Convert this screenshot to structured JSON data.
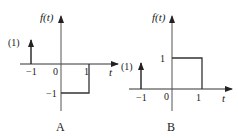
{
  "figure": {
    "panels": [
      {
        "id": "A",
        "caption": "A",
        "y_axis_label": "f(t)",
        "x_axis_label": "t",
        "impulse_label": "(1)",
        "ticks": {
          "neg_one": "−1",
          "zero": "0",
          "one": "1",
          "y_neg_one": "−1"
        },
        "description": "Unit impulse at t = −1; f(t) = −1 for 0 < t < 1"
      },
      {
        "id": "B",
        "caption": "B",
        "y_axis_label": "f(t)",
        "x_axis_label": "t",
        "impulse_label": "(1)",
        "ticks": {
          "neg_one": "−1",
          "zero": "0",
          "one": "1",
          "y_one": "1"
        },
        "description": "Unit impulse at t = −1; f(t) = 1 for 0 < t < 1"
      }
    ],
    "colors": {
      "stroke": "#2a2a2a",
      "axis": "#333333",
      "background": "#ffffff"
    }
  }
}
